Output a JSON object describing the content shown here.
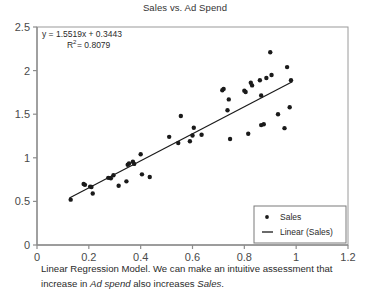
{
  "chart_data": {
    "type": "scatter",
    "title": "Sales vs. Ad Spend",
    "xlabel": "",
    "ylabel": "",
    "xlim": [
      0,
      1.2
    ],
    "ylim": [
      0,
      2.5
    ],
    "xticks": [
      "0",
      "0.2",
      "0.4",
      "0.6",
      "0.8",
      "1",
      "1.2"
    ],
    "xtick_values": [
      0,
      0.2,
      0.4,
      0.6,
      0.8,
      1.0,
      1.2
    ],
    "yticks": [
      "0",
      "0.5",
      "1",
      "1.5",
      "2",
      "2.5"
    ],
    "ytick_values": [
      0,
      0.5,
      1.0,
      1.5,
      2.0,
      2.5
    ],
    "grid": false,
    "legend_position": "bottom-right",
    "legend": [
      "Sales",
      "Linear (Sales)"
    ],
    "annotations": {
      "equation": "y = 1.5519x + 0.3443",
      "r_squared_label": "R",
      "r_squared_exponent": "2",
      "r_squared_value": "= 0.8079"
    },
    "trendline": {
      "name": "Linear (Sales)",
      "slope": 1.5519,
      "intercept": 0.3443,
      "x_start": 0.125,
      "x_end": 0.985,
      "color": "#1a1a1a"
    },
    "series": [
      {
        "name": "Sales",
        "marker": "dot",
        "color": "#1a1a1a",
        "points": [
          [
            0.13,
            0.52
          ],
          [
            0.18,
            0.7
          ],
          [
            0.185,
            0.69
          ],
          [
            0.205,
            0.67
          ],
          [
            0.21,
            0.665
          ],
          [
            0.215,
            0.59
          ],
          [
            0.275,
            0.77
          ],
          [
            0.285,
            0.765
          ],
          [
            0.295,
            0.8
          ],
          [
            0.315,
            0.68
          ],
          [
            0.345,
            0.73
          ],
          [
            0.35,
            0.92
          ],
          [
            0.355,
            0.935
          ],
          [
            0.37,
            0.955
          ],
          [
            0.375,
            0.93
          ],
          [
            0.4,
            1.04
          ],
          [
            0.405,
            0.81
          ],
          [
            0.435,
            0.78
          ],
          [
            0.51,
            1.24
          ],
          [
            0.545,
            1.17
          ],
          [
            0.555,
            1.48
          ],
          [
            0.59,
            1.19
          ],
          [
            0.6,
            1.255
          ],
          [
            0.605,
            1.345
          ],
          [
            0.635,
            1.265
          ],
          [
            0.715,
            1.775
          ],
          [
            0.72,
            1.79
          ],
          [
            0.735,
            1.545
          ],
          [
            0.74,
            1.67
          ],
          [
            0.745,
            1.215
          ],
          [
            0.8,
            1.77
          ],
          [
            0.805,
            1.755
          ],
          [
            0.815,
            1.275
          ],
          [
            0.825,
            1.86
          ],
          [
            0.83,
            1.83
          ],
          [
            0.86,
            1.89
          ],
          [
            0.865,
            1.715
          ],
          [
            0.865,
            1.375
          ],
          [
            0.875,
            1.385
          ],
          [
            0.885,
            1.915
          ],
          [
            0.9,
            2.21
          ],
          [
            0.905,
            1.95
          ],
          [
            0.93,
            1.5
          ],
          [
            0.955,
            1.34
          ],
          [
            0.965,
            2.04
          ],
          [
            0.975,
            1.58
          ],
          [
            0.98,
            1.89
          ]
        ]
      }
    ]
  },
  "caption": {
    "part1": "Linear Regression Model. We can make an intuitive assessment that increase in ",
    "italic1": "Ad spend",
    "part2": " also increases ",
    "italic2": "Sales",
    "part3": "."
  }
}
